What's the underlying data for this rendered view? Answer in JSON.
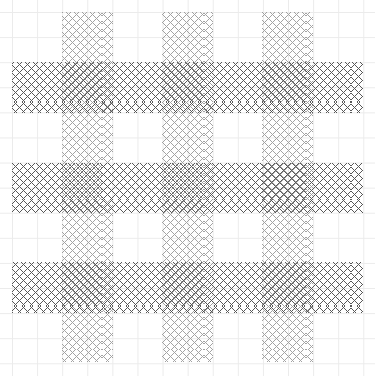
{
  "figure": {
    "width": 375,
    "height": 376,
    "background_color": "#ffffff",
    "grid": {
      "visible": true,
      "color": "#ebebeb",
      "spacing": 25.1,
      "origin_x": 12,
      "origin_y": 12
    }
  },
  "chart_data": {
    "type": "heatmap",
    "title": "",
    "subtitle": "",
    "xlabel": "",
    "ylabel": "",
    "xlim": [
      0,
      375
    ],
    "ylim": [
      0,
      376
    ],
    "grid": true,
    "legend": "none",
    "tick_labels_x": [],
    "tick_labels_y": [],
    "annotations": [],
    "hatch_styles": {
      "vertical_band": {
        "pattern": "crosshatch-45",
        "color": "#8a8a8a",
        "line_width": 0.85,
        "spacing": 5.66,
        "opacity": 0.78,
        "density": "sparse"
      },
      "horizontal_band": {
        "pattern": "crosshatch-45",
        "color": "#4a4a4a",
        "line_width": 1.05,
        "spacing": 5.66,
        "opacity": 0.92,
        "density": "dense"
      }
    },
    "series": [
      {
        "name": "vertical-bands",
        "orientation": "vertical",
        "style": "vertical_band",
        "extent_start": 12,
        "extent_end": 362,
        "bands": [
          {
            "label": "v1",
            "start": 62,
            "end": 113
          },
          {
            "label": "v2",
            "start": 162,
            "end": 213
          },
          {
            "label": "v3",
            "start": 262,
            "end": 313
          }
        ]
      },
      {
        "name": "horizontal-bands",
        "orientation": "horizontal",
        "style": "horizontal_band",
        "extent_start": 12,
        "extent_end": 363,
        "bands": [
          {
            "label": "h1",
            "start": 62,
            "end": 113
          },
          {
            "label": "h2",
            "start": 163,
            "end": 213
          },
          {
            "label": "h3",
            "start": 262,
            "end": 313
          }
        ]
      }
    ]
  }
}
